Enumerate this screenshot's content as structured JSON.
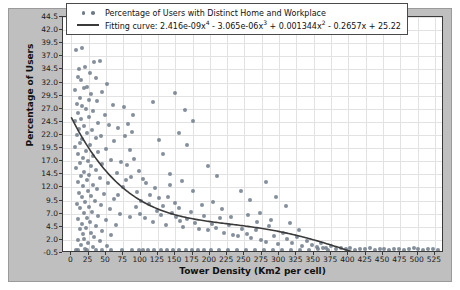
{
  "chart_data": {
    "type": "scatter",
    "title": "",
    "xlabel": "Tower Density (Km2 per cell)",
    "ylabel": "Percentage of Users",
    "xlim": [
      -12,
      538
    ],
    "ylim": [
      -0.5,
      44.5
    ],
    "grid": true,
    "legend_position": "upper center",
    "xticks": [
      0,
      25,
      50,
      75,
      100,
      125,
      150,
      175,
      200,
      225,
      250,
      275,
      300,
      325,
      350,
      375,
      400,
      425,
      450,
      475,
      500,
      525
    ],
    "yticks": [
      -0.5,
      2.0,
      4.5,
      7.0,
      9.5,
      12.0,
      14.5,
      17.0,
      19.5,
      22.0,
      24.5,
      27.0,
      29.5,
      32.0,
      34.5,
      37.0,
      39.5,
      42.0,
      44.5
    ],
    "series": [
      {
        "name": "Percentage of Users with Distinct Home and Workplace",
        "type": "scatter",
        "marker": "circle",
        "color": "#6f7b8a",
        "points": [
          [
            7,
            38.2
          ],
          [
            16,
            38.6
          ],
          [
            33,
            35.9
          ],
          [
            41,
            36.2
          ],
          [
            11,
            34.6
          ],
          [
            20,
            34.9
          ],
          [
            27,
            33.8
          ],
          [
            9,
            33.1
          ],
          [
            14,
            32.4
          ],
          [
            35,
            32.9
          ],
          [
            52,
            31.8
          ],
          [
            22,
            31.2
          ],
          [
            6,
            30.5
          ],
          [
            18,
            30.9
          ],
          [
            29,
            29.8
          ],
          [
            44,
            30.2
          ],
          [
            12,
            29.1
          ],
          [
            25,
            28.6
          ],
          [
            8,
            28.0
          ],
          [
            37,
            28.4
          ],
          [
            16,
            27.5
          ],
          [
            60,
            27.8
          ],
          [
            21,
            26.9
          ],
          [
            10,
            26.2
          ],
          [
            31,
            26.6
          ],
          [
            48,
            25.9
          ],
          [
            14,
            25.1
          ],
          [
            26,
            25.5
          ],
          [
            5,
            24.7
          ],
          [
            39,
            24.2
          ],
          [
            19,
            23.8
          ],
          [
            55,
            24.0
          ],
          [
            11,
            23.1
          ],
          [
            30,
            22.9
          ],
          [
            23,
            22.4
          ],
          [
            8,
            22.0
          ],
          [
            43,
            21.8
          ],
          [
            16,
            21.2
          ],
          [
            35,
            21.5
          ],
          [
            62,
            20.9
          ],
          [
            13,
            20.4
          ],
          [
            27,
            20.1
          ],
          [
            6,
            19.7
          ],
          [
            50,
            19.4
          ],
          [
            21,
            19.0
          ],
          [
            38,
            18.8
          ],
          [
            9,
            18.3
          ],
          [
            32,
            18.0
          ],
          [
            17,
            17.6
          ],
          [
            58,
            17.3
          ],
          [
            24,
            17.0
          ],
          [
            12,
            16.6
          ],
          [
            45,
            16.4
          ],
          [
            29,
            16.0
          ],
          [
            7,
            15.7
          ],
          [
            36,
            15.3
          ],
          [
            19,
            15.0
          ],
          [
            66,
            14.8
          ],
          [
            26,
            14.4
          ],
          [
            14,
            14.1
          ],
          [
            41,
            13.8
          ],
          [
            22,
            13.4
          ],
          [
            9,
            13.1
          ],
          [
            53,
            12.9
          ],
          [
            31,
            12.5
          ],
          [
            17,
            12.2
          ],
          [
            74,
            12.0
          ],
          [
            37,
            11.7
          ],
          [
            24,
            11.3
          ],
          [
            11,
            11.0
          ],
          [
            47,
            10.8
          ],
          [
            28,
            10.4
          ],
          [
            15,
            10.1
          ],
          [
            61,
            9.8
          ],
          [
            34,
            9.5
          ],
          [
            20,
            9.2
          ],
          [
            8,
            8.9
          ],
          [
            43,
            8.6
          ],
          [
            25,
            8.3
          ],
          [
            13,
            8.0
          ],
          [
            56,
            7.8
          ],
          [
            30,
            7.4
          ],
          [
            18,
            7.1
          ],
          [
            70,
            6.9
          ],
          [
            39,
            6.6
          ],
          [
            22,
            6.2
          ],
          [
            10,
            6.0
          ],
          [
            50,
            5.7
          ],
          [
            27,
            5.4
          ],
          [
            16,
            5.1
          ],
          [
            64,
            4.9
          ],
          [
            35,
            4.6
          ],
          [
            21,
            4.2
          ],
          [
            12,
            4.0
          ],
          [
            45,
            3.7
          ],
          [
            29,
            3.4
          ],
          [
            17,
            3.1
          ],
          [
            58,
            2.9
          ],
          [
            33,
            2.6
          ],
          [
            19,
            2.2
          ],
          [
            9,
            2.0
          ],
          [
            41,
            1.7
          ],
          [
            24,
            1.4
          ],
          [
            14,
            1.1
          ],
          [
            52,
            0.9
          ],
          [
            31,
            0.6
          ],
          [
            20,
            0.3
          ],
          [
            7,
            0.1
          ],
          [
            78,
            21.8
          ],
          [
            84,
            19.2
          ],
          [
            91,
            17.4
          ],
          [
            97,
            15.1
          ],
          [
            103,
            13.6
          ],
          [
            88,
            22.6
          ],
          [
            95,
            11.2
          ],
          [
            101,
            9.4
          ],
          [
            108,
            12.8
          ],
          [
            114,
            10.5
          ],
          [
            80,
            16.2
          ],
          [
            86,
            14.0
          ],
          [
            93,
            8.2
          ],
          [
            99,
            7.0
          ],
          [
            106,
            6.1
          ],
          [
            112,
            8.8
          ],
          [
            118,
            5.4
          ],
          [
            124,
            7.6
          ],
          [
            130,
            6.8
          ],
          [
            136,
            4.9
          ],
          [
            82,
            24.1
          ],
          [
            89,
            25.8
          ],
          [
            76,
            27.3
          ],
          [
            121,
            11.8
          ],
          [
            127,
            9.9
          ],
          [
            133,
            8.4
          ],
          [
            139,
            10.2
          ],
          [
            145,
            7.2
          ],
          [
            151,
            6.4
          ],
          [
            157,
            5.6
          ],
          [
            143,
            12.4
          ],
          [
            149,
            9.1
          ],
          [
            155,
            8.0
          ],
          [
            161,
            4.4
          ],
          [
            167,
            6.0
          ],
          [
            173,
            7.4
          ],
          [
            179,
            5.2
          ],
          [
            185,
            4.1
          ],
          [
            191,
            6.6
          ],
          [
            197,
            3.8
          ],
          [
            142,
            14.6
          ],
          [
            160,
            13.2
          ],
          [
            176,
            11.4
          ],
          [
            188,
            8.6
          ],
          [
            203,
            5.0
          ],
          [
            209,
            4.2
          ],
          [
            215,
            6.2
          ],
          [
            221,
            3.4
          ],
          [
            227,
            4.8
          ],
          [
            233,
            3.0
          ],
          [
            205,
            9.2
          ],
          [
            218,
            7.8
          ],
          [
            231,
            6.4
          ],
          [
            240,
            2.8
          ],
          [
            247,
            4.0
          ],
          [
            118,
            28.2
          ],
          [
            156,
            22.4
          ],
          [
            167,
            20.0
          ],
          [
            132,
            18.4
          ],
          [
            198,
            16.1
          ],
          [
            211,
            14.2
          ],
          [
            176,
            24.6
          ],
          [
            149,
            30.1
          ],
          [
            164,
            26.8
          ],
          [
            126,
            21.0
          ],
          [
            253,
            3.2
          ],
          [
            260,
            2.4
          ],
          [
            267,
            3.8
          ],
          [
            274,
            2.0
          ],
          [
            281,
            1.6
          ],
          [
            255,
            6.8
          ],
          [
            268,
            5.4
          ],
          [
            285,
            4.6
          ],
          [
            292,
            2.8
          ],
          [
            299,
            1.2
          ],
          [
            245,
            11.4
          ],
          [
            258,
            9.6
          ],
          [
            272,
            7.2
          ],
          [
            288,
            5.8
          ],
          [
            305,
            3.4
          ],
          [
            312,
            2.2
          ],
          [
            319,
            1.4
          ],
          [
            326,
            2.6
          ],
          [
            333,
            0.9
          ],
          [
            340,
            1.8
          ],
          [
            316,
            5.2
          ],
          [
            329,
            3.8
          ],
          [
            347,
            1.1
          ],
          [
            354,
            0.6
          ],
          [
            361,
            1.5
          ],
          [
            281,
            13.0
          ],
          [
            296,
            10.2
          ],
          [
            310,
            8.4
          ],
          [
            368,
            0.4
          ],
          [
            375,
            0.8
          ],
          [
            382,
            0.3
          ],
          [
            389,
            0.5
          ],
          [
            396,
            0.2
          ],
          [
            403,
            0.4
          ],
          [
            410,
            0.1
          ],
          [
            417,
            0.3
          ],
          [
            424,
            0.2
          ],
          [
            431,
            0.4
          ],
          [
            438,
            0.1
          ],
          [
            445,
            0.2
          ],
          [
            452,
            0.3
          ],
          [
            459,
            0.1
          ],
          [
            466,
            0.2
          ],
          [
            473,
            0.3
          ],
          [
            480,
            0.1
          ],
          [
            487,
            0.2
          ],
          [
            494,
            0.4
          ],
          [
            501,
            0.2
          ],
          [
            508,
            0.1
          ],
          [
            515,
            0.3
          ],
          [
            522,
            0.2
          ],
          [
            529,
            0.1
          ],
          [
            356,
            0.2
          ],
          [
            363,
            0.4
          ],
          [
            370,
            0.1
          ],
          [
            36,
            0.0
          ],
          [
            58,
            0.0
          ],
          [
            73,
            0.0
          ],
          [
            88,
            0.0
          ],
          [
            97,
            0.0
          ],
          [
            104,
            0.0
          ],
          [
            111,
            0.0
          ],
          [
            120,
            0.0
          ],
          [
            129,
            0.0
          ],
          [
            138,
            0.0
          ],
          [
            147,
            0.0
          ],
          [
            156,
            0.0
          ],
          [
            165,
            0.0
          ],
          [
            174,
            0.0
          ],
          [
            183,
            0.0
          ],
          [
            192,
            0.0
          ],
          [
            201,
            0.0
          ],
          [
            213,
            0.0
          ],
          [
            226,
            0.0
          ],
          [
            239,
            0.0
          ],
          [
            252,
            0.0
          ],
          [
            265,
            0.0
          ],
          [
            278,
            0.0
          ],
          [
            291,
            0.0
          ],
          [
            304,
            0.0
          ],
          [
            317,
            0.0
          ],
          [
            330,
            0.0
          ],
          [
            343,
            0.0
          ],
          [
            10,
            0.0
          ],
          [
            22,
            0.0
          ],
          [
            45,
            0.0
          ],
          [
            68,
            23.4
          ],
          [
            72,
            16.8
          ],
          [
            67,
            10.6
          ],
          [
            79,
            13.4
          ],
          [
            85,
            6.4
          ]
        ]
      },
      {
        "name": "Fitting curve: 2.416e-09x⁴ - 3.065e-06x³ + 0.001344x² - 0.2657x + 25.22",
        "type": "line",
        "color": "#3a3a3a",
        "coefficients": {
          "x4": 2.416e-09,
          "x3": -3.065e-06,
          "x2": 0.001344,
          "x1": -0.2657,
          "x0": 25.22
        },
        "x_range": [
          0,
          420
        ]
      }
    ]
  },
  "legend": {
    "entries": [
      {
        "key": "scatter-marker",
        "label": "Percentage of Users with Distinct Home and Workplace"
      },
      {
        "key": "line-marker",
        "label_prefix": "Fitting curve: 2.416e-09x",
        "sup1": "4",
        "term2": " - 3.065e-06x",
        "sup2": "3",
        "term3": " + 0.001344x",
        "sup3": "2",
        "term4": " - 0.2657x + 25.22"
      }
    ]
  },
  "colors": {
    "figure_background": "#bfbfbf",
    "plot_background": "#ffffff",
    "grid": "#e2e2e2",
    "axis": "#3a3a3a",
    "marker": "#6f7b8a",
    "curve": "#3a3a3a"
  }
}
